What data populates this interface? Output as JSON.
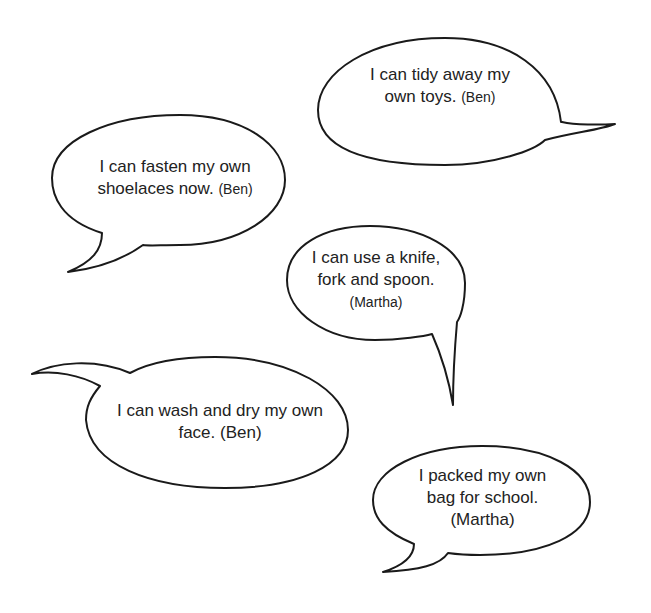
{
  "bubbles": [
    {
      "id": "tidy-toys",
      "lines": [
        "I can tidy away my",
        "own toys."
      ],
      "speaker": "(Ben)",
      "speaker_inline": true
    },
    {
      "id": "shoelaces",
      "lines": [
        "I can fasten my own",
        "shoelaces now."
      ],
      "speaker": "(Ben)",
      "speaker_inline": true
    },
    {
      "id": "knife-fork-spoon",
      "lines": [
        "I can use a knife,",
        "fork and spoon."
      ],
      "speaker": "(Martha)",
      "speaker_inline": false
    },
    {
      "id": "wash-face",
      "lines": [
        "I can wash and dry my own",
        "face."
      ],
      "speaker": "(Ben)",
      "speaker_inline": true
    },
    {
      "id": "packed-bag",
      "lines": [
        "I packed my own",
        "bag for school."
      ],
      "speaker": "(Martha)",
      "speaker_inline": false
    }
  ],
  "colors": {
    "outline": "#1a1a1a",
    "text": "#222222",
    "background": "#ffffff"
  }
}
